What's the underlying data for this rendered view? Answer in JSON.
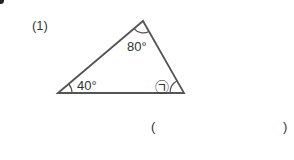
{
  "problem": {
    "number": "(1)",
    "angles": {
      "top": "80°",
      "left": "40°",
      "right_symbol": "㉠"
    },
    "answer": {
      "open": "(",
      "value": "",
      "close": ")"
    }
  },
  "colors": {
    "stroke": "#555555",
    "text": "#333333"
  }
}
